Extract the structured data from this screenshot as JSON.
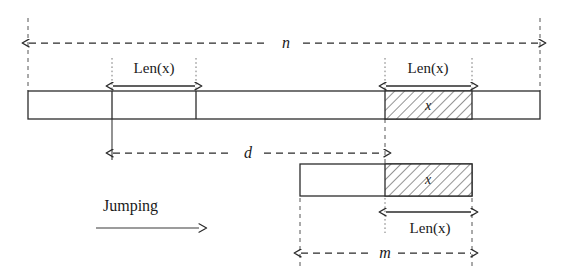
{
  "figure": {
    "colors": {
      "ink": "#2b2b2b",
      "background": "#ffffff",
      "guide": "#777777",
      "hatch": "#3a3a3a"
    }
  },
  "labels": {
    "n": "n",
    "d": "d",
    "m": "m",
    "len_top_left": "Len(x)",
    "len_top_right": "Len(x)",
    "len_bottom": "Len(x)",
    "pattern_top": "x",
    "pattern_bottom": "x",
    "jumping": "Jumping"
  },
  "icons": {
    "arrow_double_n": "double-headed-dashed-arrow",
    "arrow_double_d": "double-headed-dashed-arrow",
    "arrow_double_m": "double-headed-dashed-arrow",
    "arrow_len": "double-headed-solid-arrow",
    "arrow_jumping": "right-arrow"
  },
  "geometry": {
    "text_line_n_y": 47,
    "text_line_d_y": 157,
    "text_line_m_y": 257,
    "top_bar": {
      "x": 28,
      "y": 91,
      "width": 512,
      "height": 28
    },
    "bottom_bar": {
      "x": 300,
      "y": 164,
      "width": 172,
      "height": 32
    },
    "top_pattern": {
      "x": 385,
      "width": 87
    },
    "bottom_pattern": {
      "x": 385,
      "width": 87
    }
  }
}
